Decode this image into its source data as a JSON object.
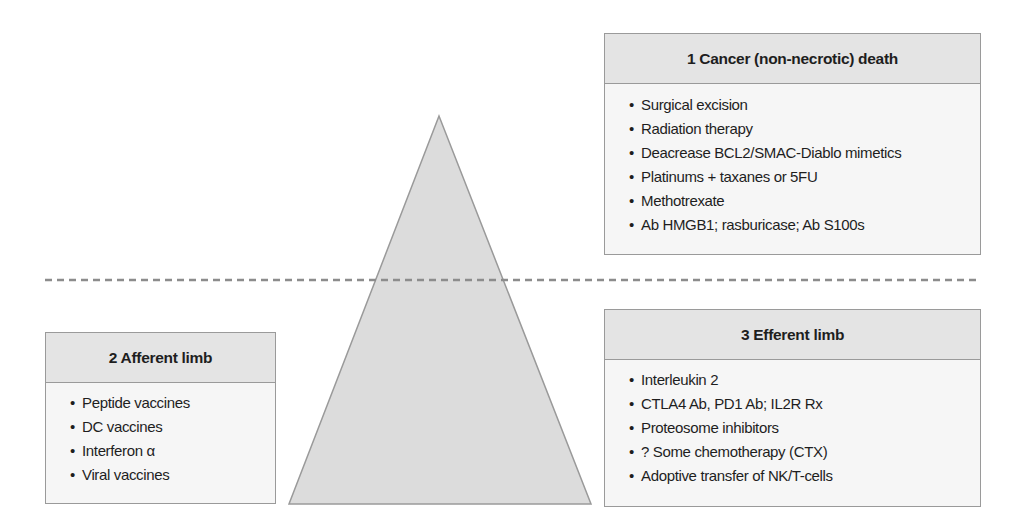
{
  "diagram": {
    "colors": {
      "triangle_fill": "#dcdcdc",
      "triangle_stroke": "#9a9a9a",
      "dashed_line": "#8c8c8c",
      "box_header": "#e4e4e4",
      "box_body": "#f6f6f6",
      "box_border": "#9a9a9a"
    },
    "bullet": "•",
    "boxes": {
      "death": {
        "title": "1 Cancer (non-necrotic) death",
        "items": [
          "Surgical excision",
          "Radiation therapy",
          "Deacrease BCL2/SMAC-Diablo mimetics",
          "Platinums + taxanes or 5FU",
          "Methotrexate",
          "Ab HMGB1; rasburicase; Ab S100s"
        ]
      },
      "afferent": {
        "title": "2 Afferent limb",
        "items": [
          "Peptide vaccines",
          "DC vaccines",
          "Interferon α",
          "Viral vaccines"
        ]
      },
      "efferent": {
        "title": "3 Efferent limb",
        "items": [
          "Interleukin 2",
          "CTLA4 Ab, PD1 Ab; IL2R Rx",
          "Proteosome inhibitors",
          "? Some chemotherapy (CTX)",
          "Adoptive transfer of NK/T-cells"
        ]
      }
    }
  }
}
